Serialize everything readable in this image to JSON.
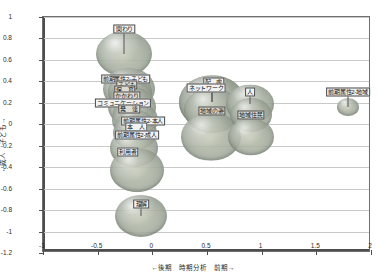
{
  "chart_data": {
    "type": "scatter",
    "title": "",
    "xlabel": "←後期　時期分析　前期→",
    "ylabel": "←成人　子ども→",
    "xlim": [
      -1,
      2
    ],
    "ylim": [
      -1.2,
      1
    ],
    "xticks": [
      "-1",
      "-0.5",
      "0",
      "0.5",
      "1",
      "1.5",
      "2"
    ],
    "xtickvals": [
      -1,
      -0.5,
      0,
      0.5,
      1,
      1.5,
      2
    ],
    "yticks": [
      "1",
      "0.8",
      "0.6",
      "0.4",
      "0.2",
      "0",
      "-0.2",
      "-0.4",
      "-0.6",
      "-0.8",
      "-1",
      "-1.2"
    ],
    "ytickvals": [
      1,
      0.8,
      0.6,
      0.4,
      0.2,
      0,
      -0.2,
      -0.4,
      -0.6,
      -0.8,
      -1,
      -1.2
    ],
    "grid": true,
    "legend": false,
    "points": [
      {
        "label": "関わり",
        "x": -0.255,
        "y": 0.655,
        "r": 28,
        "lx": -0.255,
        "ly": 0.885,
        "ldim": false
      },
      {
        "label": "前期属性2-子ども",
        "x": -0.21,
        "y": 0.33,
        "r": 26,
        "lx": -0.245,
        "ly": 0.425,
        "ldim": false
      },
      {
        "label": "子ども",
        "x": -0.205,
        "y": 0.3,
        "r": 22,
        "lx": -0.232,
        "ly": 0.368,
        "ldim": true
      },
      {
        "label": "保　育",
        "x": -0.195,
        "y": 0.255,
        "r": 21,
        "lx": -0.252,
        "ly": 0.318,
        "ldim": true
      },
      {
        "label": "かかわり",
        "x": -0.188,
        "y": 0.205,
        "r": 19,
        "lx": -0.232,
        "ly": 0.262,
        "ldim": true
      },
      {
        "label": "コミュニケーション",
        "x": -0.19,
        "y": 0.16,
        "r": 24,
        "lx": -0.268,
        "ly": 0.198,
        "ldim": false
      },
      {
        "label": "発　達",
        "x": -0.18,
        "y": 0.1,
        "r": 20,
        "lx": -0.212,
        "ly": 0.142,
        "ldim": true
      },
      {
        "label": "前期属性2-本人",
        "x": -0.16,
        "y": 0.04,
        "r": 23,
        "lx": -0.082,
        "ly": 0.035,
        "ldim": false
      },
      {
        "label": "本　人",
        "x": -0.16,
        "y": -0.02,
        "r": 20,
        "lx": -0.148,
        "ly": -0.028,
        "ldim": false
      },
      {
        "label": "前期属性2-成人",
        "x": -0.155,
        "y": -0.08,
        "r": 22,
        "lx": -0.14,
        "ly": -0.098,
        "ldim": false
      },
      {
        "label": "利用者",
        "x": -0.17,
        "y": -0.225,
        "r": 24,
        "lx": -0.225,
        "ly": -0.258,
        "ldim": false
      },
      {
        "label": "",
        "x": -0.14,
        "y": -0.43,
        "r": 27,
        "lx": null,
        "ly": null,
        "ldim": false
      },
      {
        "label": "理解",
        "x": -0.1,
        "y": -0.855,
        "r": 26,
        "lx": -0.1,
        "ly": -0.742,
        "ldim": false
      },
      {
        "label": "配　慮",
        "x": 0.545,
        "y": 0.205,
        "r": 33,
        "lx": 0.56,
        "ly": 0.392,
        "ldim": false
      },
      {
        "label": "ネットワーク",
        "x": 0.545,
        "y": 0.205,
        "r": 33,
        "lx": 0.492,
        "ly": 0.338,
        "ldim": false
      },
      {
        "label": "地域の姿",
        "x": 0.545,
        "y": 0.13,
        "r": 28,
        "lx": 0.545,
        "ly": 0.125,
        "ldim": true
      },
      {
        "label": "",
        "x": 0.54,
        "y": -0.115,
        "r": 30,
        "lx": null,
        "ly": null,
        "ldim": false
      },
      {
        "label": "人",
        "x": 0.895,
        "y": 0.185,
        "r": 24,
        "lx": 0.895,
        "ly": 0.302,
        "ldim": false
      },
      {
        "label": "地域住民",
        "x": 0.9,
        "y": 0.09,
        "r": 21,
        "lx": 0.9,
        "ly": 0.085,
        "ldim": true
      },
      {
        "label": "",
        "x": 0.905,
        "y": -0.12,
        "r": 23,
        "lx": null,
        "ly": null,
        "ldim": false
      },
      {
        "label": "前期属性2-地域",
        "x": 1.79,
        "y": 0.16,
        "r": 11,
        "lx": 1.79,
        "ly": 0.3,
        "ldim": false
      }
    ]
  }
}
